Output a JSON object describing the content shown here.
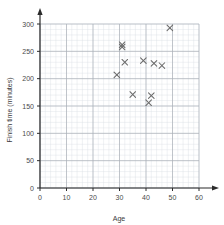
{
  "chart_data": {
    "type": "scatter",
    "title": "",
    "xlabel": "Age",
    "ylabel": "Finish time (minutes)",
    "xlim": [
      0,
      60
    ],
    "ylim": [
      0,
      300
    ],
    "xticks": [
      0,
      10,
      20,
      30,
      40,
      50,
      60
    ],
    "yticks": [
      0,
      50,
      100,
      150,
      200,
      250,
      300
    ],
    "xtick_labels": [
      "0",
      "10",
      "20",
      "30",
      "40",
      "50",
      "60"
    ],
    "ytick_labels": [
      "0",
      "50",
      "100",
      "150",
      "200",
      "250",
      "300"
    ],
    "grid": true,
    "grid_minor_step_x": 2,
    "grid_minor_step_y": 10,
    "grid_major_step_x": 10,
    "grid_major_step_y": 50,
    "legend": null,
    "marker": "x",
    "marker_color": "#6b6b6b",
    "points": [
      {
        "x": 29,
        "y": 207
      },
      {
        "x": 31,
        "y": 262
      },
      {
        "x": 31,
        "y": 258
      },
      {
        "x": 32,
        "y": 230
      },
      {
        "x": 35,
        "y": 171
      },
      {
        "x": 39,
        "y": 233
      },
      {
        "x": 41,
        "y": 156
      },
      {
        "x": 42,
        "y": 169
      },
      {
        "x": 43,
        "y": 228
      },
      {
        "x": 46,
        "y": 224
      },
      {
        "x": 49,
        "y": 293
      }
    ]
  },
  "colors": {
    "background": "#ffffff",
    "grid_minor": "#d9dde2",
    "grid_major": "#aab0b8",
    "axis": "#2b2b2b",
    "text": "#3a3a3a",
    "marker": "#6b6b6b"
  }
}
